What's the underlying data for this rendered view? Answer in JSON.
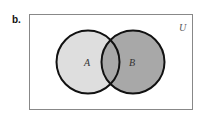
{
  "part_label": "b.",
  "universe_label": "U",
  "sets": [
    {
      "label": "A",
      "fill": "#dedede"
    },
    {
      "label": "B",
      "fill": "#a8a8a8"
    }
  ],
  "intersection_fill": "#a8a8a8",
  "stroke_color": "#111111",
  "frame_color": "#888888"
}
